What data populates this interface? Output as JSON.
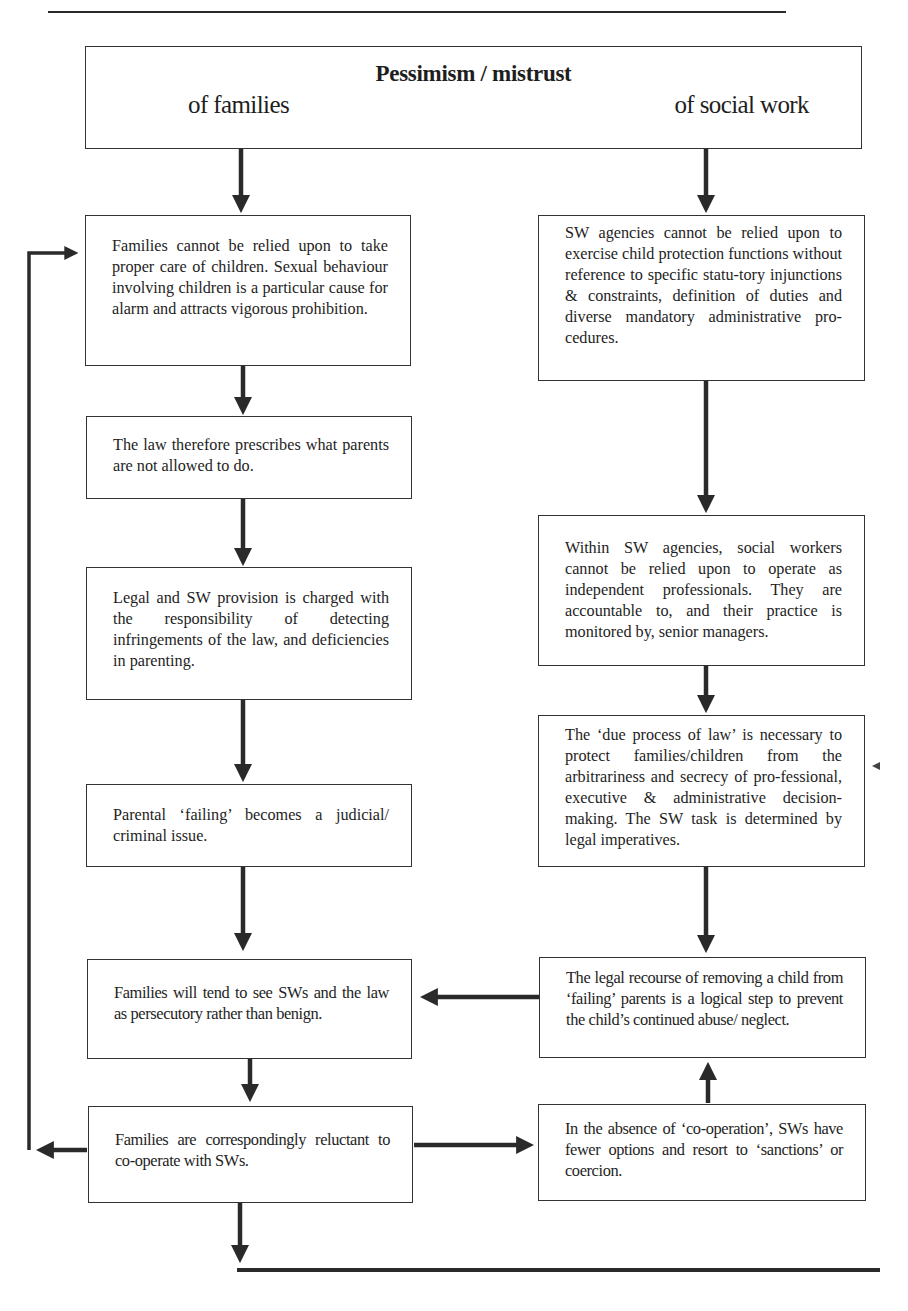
{
  "diagram": {
    "header": {
      "title": "Pessimism / mistrust",
      "left_subtitle": "of families",
      "right_subtitle": "of social work"
    },
    "left_column": [
      {
        "id": "L1",
        "text": "Families cannot be relied upon to take proper care of children. Sexual behaviour involving children is a particular cause for alarm and attracts vigorous prohibition."
      },
      {
        "id": "L2",
        "text": "The law therefore prescribes what parents are not allowed to do."
      },
      {
        "id": "L3",
        "text": "Legal and SW provision is charged with the responsibility of detecting infringements of the law, and deficiencies in parenting."
      },
      {
        "id": "L4",
        "text": "Parental ‘failing’ becomes a judicial/ criminal issue."
      },
      {
        "id": "L5",
        "text": "Families will tend to see SWs and the law as persecutory rather than benign."
      },
      {
        "id": "L6",
        "text": "Families are correspondingly reluctant to co-operate with SWs."
      }
    ],
    "right_column": [
      {
        "id": "R1",
        "text": "SW agencies cannot be relied upon to exercise child protection functions without reference to specific statu-tory injunctions & constraints, definition of duties and diverse mandatory administrative pro-cedures."
      },
      {
        "id": "R2",
        "text": "Within SW agencies, social workers cannot be relied upon to operate as independent professionals. They are accountable to, and their practice is monitored by, senior managers."
      },
      {
        "id": "R3",
        "text": "The ‘due process of law’ is necessary to protect families/children from the arbitrariness and secrecy of pro-fessional, executive & administrative decision-making. The SW task is determined by legal imperatives."
      },
      {
        "id": "R4",
        "text": "The legal recourse of removing a child from ‘failing’ parents is a logical step to prevent the child’s continued abuse/ neglect."
      },
      {
        "id": "R5",
        "text": "In the absence of ‘co-operation’, SWs have fewer options and resort to ‘sanctions’ or coercion."
      }
    ],
    "connections": [
      {
        "from": "header",
        "to": "L1"
      },
      {
        "from": "header",
        "to": "R1"
      },
      {
        "from": "L1",
        "to": "L2"
      },
      {
        "from": "L2",
        "to": "L3"
      },
      {
        "from": "L3",
        "to": "L4"
      },
      {
        "from": "L4",
        "to": "L5"
      },
      {
        "from": "L5",
        "to": "L6"
      },
      {
        "from": "R1",
        "to": "R2"
      },
      {
        "from": "R2",
        "to": "R3"
      },
      {
        "from": "R3",
        "to": "R4"
      },
      {
        "from": "R4",
        "to": "L5"
      },
      {
        "from": "L6",
        "to": "R5"
      },
      {
        "from": "R5",
        "to": "R4"
      },
      {
        "from": "L6",
        "to": "L1",
        "note": "feedback loop along left margin"
      },
      {
        "from": "L6",
        "to": "continues below"
      }
    ],
    "colors": {
      "ink": "#2a2a2a",
      "paper": "#ffffff"
    }
  }
}
